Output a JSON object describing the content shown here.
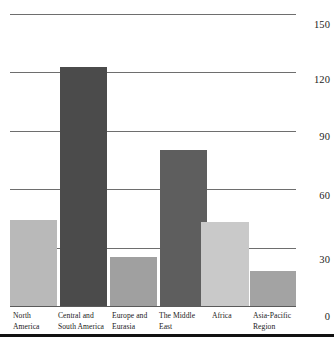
{
  "chart_data": {
    "type": "bar",
    "title": "",
    "subtitle": "",
    "xlabel": "",
    "ylabel": "",
    "categories": [
      "North America",
      "Central and South America",
      "Europe and Eurasia",
      "The Middle East",
      "Africa",
      "Asia-Pacific Region"
    ],
    "values": [
      44,
      123,
      25,
      80,
      43,
      18
    ],
    "ylim": [
      0,
      150
    ],
    "yticks": [
      0,
      30,
      60,
      90,
      120,
      150
    ],
    "ytick_labels": [
      "0",
      "30",
      "60",
      "90",
      "120",
      "150"
    ],
    "grid": true,
    "legend": "none",
    "bar_colors": [
      "#b9b9b9",
      "#4b4b4b",
      "#a0a0a0",
      "#5e5e5e",
      "#c9c9c9",
      "#a3a3a3"
    ],
    "gridline_color": "#6e6e6e",
    "background_color": "#ffffff",
    "text_color": "#1a1a1a"
  },
  "axis": {
    "y_labels": {
      "t150": "150",
      "t120": "120",
      "t90": "90",
      "t60": "60",
      "t30": "30",
      "t0": "0"
    },
    "x_labels": {
      "north_america_line1": "North",
      "north_america_line2": "America",
      "central_south_line1": "Central and",
      "central_south_line2": "South America",
      "europe_eurasia_line1": "Europe and",
      "europe_eurasia_line2": "Eurasia",
      "middle_east_line1": "The Middle",
      "middle_east_line2": "East",
      "africa_line1": "Africa",
      "asia_pacific_line1": "Asia-Pacific",
      "asia_pacific_line2": "Region"
    }
  }
}
